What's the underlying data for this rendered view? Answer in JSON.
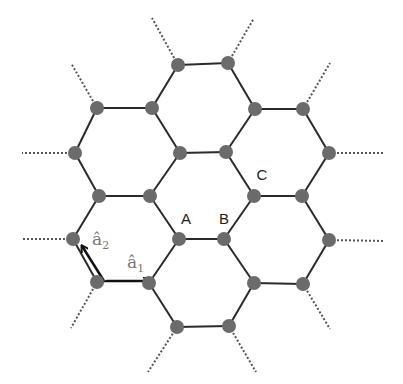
{
  "diagram": {
    "colors": {
      "bond": "#2a2a2a",
      "node": "#6b6b6b",
      "dotted": "#555555",
      "arrow": "#111111",
      "vector_label": "#777777",
      "site_label": "#222222"
    },
    "nodes": [
      [
        178,
        65
      ],
      [
        228,
        63
      ],
      [
        97,
        108
      ],
      [
        152,
        108
      ],
      [
        255,
        109
      ],
      [
        303,
        109
      ],
      [
        75,
        153
      ],
      [
        180,
        153
      ],
      [
        226,
        152
      ],
      [
        329,
        153
      ],
      [
        99,
        196
      ],
      [
        150,
        196
      ],
      [
        254,
        196
      ],
      [
        302,
        196
      ],
      [
        73,
        239
      ],
      [
        179,
        239
      ],
      [
        224,
        239
      ],
      [
        329,
        240
      ],
      [
        97,
        282
      ],
      [
        149,
        283
      ],
      [
        254,
        283
      ],
      [
        303,
        284
      ],
      [
        177,
        327
      ],
      [
        229,
        326
      ]
    ],
    "bonds": [
      [
        0,
        1
      ],
      [
        0,
        3
      ],
      [
        1,
        4
      ],
      [
        2,
        3
      ],
      [
        4,
        5
      ],
      [
        2,
        6
      ],
      [
        3,
        7
      ],
      [
        4,
        8
      ],
      [
        5,
        9
      ],
      [
        6,
        10
      ],
      [
        7,
        11
      ],
      [
        7,
        8
      ],
      [
        8,
        12
      ],
      [
        9,
        13
      ],
      [
        10,
        11
      ],
      [
        12,
        13
      ],
      [
        10,
        14
      ],
      [
        11,
        15
      ],
      [
        12,
        16
      ],
      [
        13,
        17
      ],
      [
        15,
        16
      ],
      [
        14,
        18
      ],
      [
        15,
        19
      ],
      [
        16,
        20
      ],
      [
        17,
        21
      ],
      [
        18,
        19
      ],
      [
        20,
        21
      ],
      [
        19,
        22
      ],
      [
        20,
        23
      ],
      [
        22,
        23
      ]
    ],
    "dangling": [
      [
        [
          178,
          65
        ],
        [
          152,
          18
        ]
      ],
      [
        [
          228,
          63
        ],
        [
          254,
          18
        ]
      ],
      [
        [
          97,
          108
        ],
        [
          71,
          63
        ]
      ],
      [
        [
          303,
          109
        ],
        [
          330,
          63
        ]
      ],
      [
        [
          75,
          153
        ],
        [
          22,
          153
        ]
      ],
      [
        [
          329,
          153
        ],
        [
          385,
          153
        ]
      ],
      [
        [
          73,
          239
        ],
        [
          22,
          239
        ]
      ],
      [
        [
          329,
          240
        ],
        [
          385,
          241
        ]
      ],
      [
        [
          97,
          282
        ],
        [
          71,
          328
        ]
      ],
      [
        [
          303,
          284
        ],
        [
          330,
          329
        ]
      ],
      [
        [
          177,
          327
        ],
        [
          148,
          372
        ]
      ],
      [
        [
          229,
          326
        ],
        [
          256,
          372
        ]
      ]
    ],
    "site_labels": [
      {
        "text": "A",
        "x": 186,
        "y": 224
      },
      {
        "text": "B",
        "x": 224,
        "y": 224
      },
      {
        "text": "C",
        "x": 262,
        "y": 180
      }
    ],
    "vectors": [
      {
        "name": "a1",
        "label": "â",
        "subscript": "1",
        "from": [
          104,
          281
        ],
        "to": [
          149,
          281
        ],
        "label_x": 127,
        "label_y": 268
      },
      {
        "name": "a2",
        "label": "â",
        "subscript": "2",
        "from": [
          104,
          281
        ],
        "to": [
          82,
          246
        ],
        "label_x": 92,
        "label_y": 245
      }
    ]
  }
}
